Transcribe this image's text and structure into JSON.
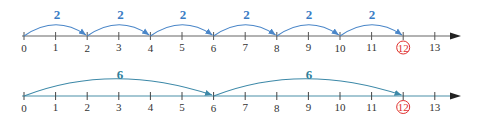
{
  "colors": {
    "axis_top": "#555555",
    "axis_bottom": "#4a90a8",
    "jump_top": "#4a86c8",
    "jump_bottom": "#3d89a8",
    "label_top": "#3a7cc4",
    "label_bottom": "#2f7f9c",
    "highlight": "#e03030"
  },
  "number_lines": [
    {
      "id": "skip-by-2",
      "ticks": [
        "0",
        "1",
        "2",
        "3",
        "4",
        "5",
        "6",
        "7",
        "8",
        "9",
        "10",
        "11",
        "12",
        "13"
      ],
      "highlighted": "12",
      "jumps": [
        {
          "from": 0,
          "to": 2,
          "label": "2"
        },
        {
          "from": 2,
          "to": 4,
          "label": "2"
        },
        {
          "from": 4,
          "to": 6,
          "label": "2"
        },
        {
          "from": 6,
          "to": 8,
          "label": "2"
        },
        {
          "from": 8,
          "to": 10,
          "label": "2"
        },
        {
          "from": 10,
          "to": 12,
          "label": "2"
        }
      ]
    },
    {
      "id": "skip-by-6",
      "ticks": [
        "0",
        "1",
        "2",
        "3",
        "4",
        "5",
        "6",
        "7",
        "8",
        "9",
        "10",
        "11",
        "12",
        "13"
      ],
      "highlighted": "12",
      "jumps": [
        {
          "from": 0,
          "to": 6,
          "label": "6"
        },
        {
          "from": 6,
          "to": 12,
          "label": "6"
        }
      ]
    }
  ]
}
